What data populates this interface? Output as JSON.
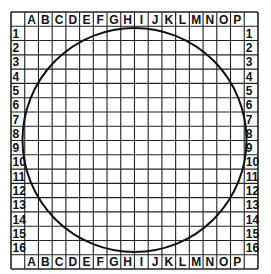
{
  "grid": {
    "columns": [
      "A",
      "B",
      "C",
      "D",
      "E",
      "F",
      "G",
      "H",
      "I",
      "J",
      "K",
      "L",
      "M",
      "N",
      "O",
      "P"
    ],
    "rows": [
      "1",
      "2",
      "3",
      "4",
      "5",
      "6",
      "7",
      "8",
      "9",
      "10",
      "11",
      "12",
      "13",
      "14",
      "15",
      "16"
    ],
    "origin": [
      11,
      12
    ],
    "cell_w": 13.72,
    "cell_h": 14.28,
    "line_color": "#222222"
  },
  "circle": {
    "cx": 134.5,
    "cy": 140,
    "r": 112,
    "stroke": "#111111"
  }
}
